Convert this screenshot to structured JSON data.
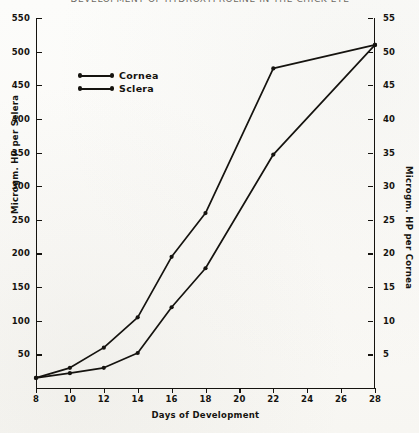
{
  "figure": {
    "title_sliver": "DEVELOPMENT OF HYDROXYPROLINE IN THE CHICK EYE",
    "xtitle": "Days of Development",
    "ytitle_left": "Microgm. HP per Sclera",
    "ytitle_right": "Microgm. HP per Cornea"
  },
  "legend": {
    "items": [
      {
        "label": "Cornea",
        "marker": "line-with-end-dots"
      },
      {
        "label": "Sclera",
        "marker": "line-with-end-dots"
      }
    ]
  },
  "axes": {
    "x_ticks": [
      "8",
      "10",
      "12",
      "14",
      "16",
      "18",
      "20",
      "22",
      "24",
      "26",
      "28"
    ],
    "y_left_ticks": [
      "550",
      "500",
      "450",
      "400",
      "350",
      "300",
      "250",
      "200",
      "150",
      "100",
      "50"
    ],
    "y_right_ticks": [
      "55",
      "50",
      "45",
      "40",
      "35",
      "30",
      "25",
      "20",
      "15",
      "10",
      "5"
    ]
  },
  "chart_data": {
    "type": "line",
    "title": "DEVELOPMENT OF HYDROXYPROLINE IN THE CHICK EYE",
    "xlabel": "Days of Development",
    "ylabel": "Microgm. HP per Sclera",
    "ylabel_secondary": "Microgm. HP per Cornea",
    "x": [
      8,
      10,
      12,
      14,
      16,
      18,
      20,
      22,
      28
    ],
    "xlim": [
      8,
      28
    ],
    "ylim": [
      0,
      550
    ],
    "ylim_secondary": [
      0,
      55
    ],
    "grid": false,
    "legend_position": "upper-left",
    "series": [
      {
        "name": "Cornea",
        "axis": "right",
        "units": "Microgm. HP per Cornea",
        "x": [
          8,
          10,
          12,
          14,
          16,
          18,
          22,
          28
        ],
        "values": [
          1.5,
          3.0,
          6.0,
          10.5,
          19.5,
          26.0,
          47.5,
          51.0
        ]
      },
      {
        "name": "Sclera",
        "axis": "left",
        "units": "Microgm. HP per Sclera",
        "x": [
          8,
          10,
          12,
          14,
          16,
          18,
          22,
          28
        ],
        "values": [
          15,
          22,
          30,
          52,
          120,
          178,
          347,
          510
        ]
      }
    ]
  },
  "geometry": {
    "plot_width": 339,
    "plot_height": 370,
    "x_first": 8,
    "x_last": 28,
    "y_left_max": 550,
    "y_left_baseline_value": 0
  }
}
